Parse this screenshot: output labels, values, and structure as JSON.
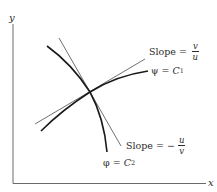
{
  "axes": {
    "x_label": "x",
    "y_label": "y"
  },
  "curves": {
    "psi": {
      "name": "ψ",
      "constant": "C",
      "subscript": "1",
      "equals": "="
    },
    "phi": {
      "name": "φ",
      "constant": "C",
      "subscript": "2",
      "equals": "="
    }
  },
  "tangents": {
    "psi_slope": {
      "word": "Slope =",
      "sign": "",
      "numerator": "v",
      "denominator": "u"
    },
    "phi_slope": {
      "word": "Slope =",
      "sign": "−",
      "numerator": "u",
      "denominator": "v"
    }
  },
  "colors": {
    "ink": "#2a2a2a",
    "background": "#ffffff"
  }
}
